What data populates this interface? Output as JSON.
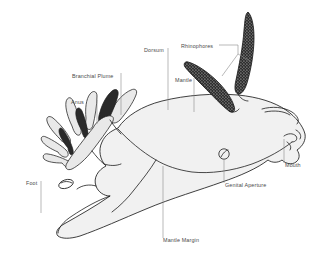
{
  "figure": {
    "background_color": "#ffffff",
    "body_fill_color": "#f1f1f1",
    "outline_color": "#1d1d1d",
    "label_color": "#4a4a4a",
    "leader_color": "#8a8a8a"
  },
  "labels": [
    {
      "id": "branchial-plume",
      "text": "Branchial Plume",
      "x": 72,
      "y": 78,
      "anchor": "start"
    },
    {
      "id": "anus",
      "text": "Anus",
      "x": 71,
      "y": 104,
      "anchor": "start"
    },
    {
      "id": "foot",
      "text": "Foot",
      "x": 26,
      "y": 185,
      "anchor": "start"
    },
    {
      "id": "dorsum",
      "text": "Dorsum",
      "x": 144,
      "y": 52,
      "anchor": "start"
    },
    {
      "id": "mantle",
      "text": "Mantle",
      "x": 175,
      "y": 82,
      "anchor": "start"
    },
    {
      "id": "rhinophores",
      "text": "Rhinophores",
      "x": 181,
      "y": 48,
      "anchor": "start"
    },
    {
      "id": "mantle-margin",
      "text": "Mantle Margin",
      "x": 163,
      "y": 242,
      "anchor": "start"
    },
    {
      "id": "genital-aperture",
      "text": "Genital Aperture",
      "x": 225,
      "y": 187,
      "anchor": "start"
    },
    {
      "id": "mouth",
      "text": "Mouth",
      "x": 285,
      "y": 167,
      "anchor": "start"
    }
  ],
  "leaders": [
    {
      "id": "leader-branchial-plume",
      "d": "M 121 73 L 121 115"
    },
    {
      "id": "leader-anus",
      "d": "M 97 100 L 97 124"
    },
    {
      "id": "leader-foot",
      "d": "M 41 181 L 41 213"
    },
    {
      "id": "leader-dorsum",
      "d": "M 168 48 L 168 110"
    },
    {
      "id": "leader-mantle",
      "d": "M 194 78 L 194 112"
    },
    {
      "id": "leader-rhinophores",
      "d": "M 219 45 L 238 45 L 238 54 M 238 54 L 222 76 M 238 54 L 250 61"
    },
    {
      "id": "leader-mantle-margin",
      "d": "M 163 238 L 163 166"
    },
    {
      "id": "leader-genital-aperture",
      "d": "M 224 183 L 224 160"
    },
    {
      "id": "leader-mouth",
      "d": "M 284 163 L 284 139"
    }
  ],
  "structures": [
    {
      "id": "body",
      "name": "main-body-dorsum"
    },
    {
      "id": "mantle-margin-line",
      "name": "mantle-margin-edge"
    },
    {
      "id": "foot-tail",
      "name": "foot-posterior-tail"
    },
    {
      "id": "branchial-plume",
      "name": "branchial-plume-gills",
      "branch_count": 9
    },
    {
      "id": "rhinophore-left",
      "name": "rhinophore-anterior-left"
    },
    {
      "id": "rhinophore-right",
      "name": "rhinophore-posterior-right"
    },
    {
      "id": "genital-aperture",
      "name": "genital-aperture-opening"
    },
    {
      "id": "mouth",
      "name": "mouth-oral-tentacles"
    }
  ]
}
